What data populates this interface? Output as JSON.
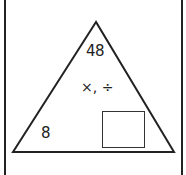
{
  "diagram": {
    "type": "fact-family-triangle",
    "top_value": "48",
    "operations": "×, ÷",
    "left_value": "8",
    "right_value": "",
    "right_value_is_blank_box": true
  },
  "colors": {
    "line": "#222222",
    "background": "#ffffff"
  }
}
